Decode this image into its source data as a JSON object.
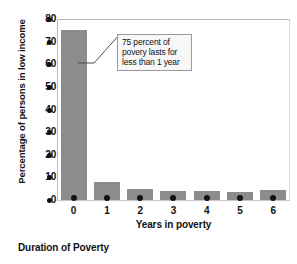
{
  "chart_data": {
    "type": "bar",
    "title": "",
    "categories": [
      "0",
      "1",
      "2",
      "3",
      "4",
      "5",
      "6"
    ],
    "values": [
      75,
      8,
      5,
      4,
      4,
      3.5,
      4.5
    ],
    "xlabel": "Years in poverty",
    "ylabel": "Percentage of persons in low income",
    "ylim": [
      0,
      80
    ],
    "ytick_step": 10,
    "yticks": [
      "80",
      "70",
      "60",
      "50",
      "40",
      "30",
      "20",
      "10",
      "0"
    ],
    "grid": false,
    "legend": false,
    "bar_color": "#8c8c8c",
    "annotations": [
      {
        "target_category": "0",
        "lines": [
          "75 percent of",
          "povery lasts for",
          "less than 1 year"
        ]
      }
    ]
  },
  "caption": "Duration of Poverty"
}
